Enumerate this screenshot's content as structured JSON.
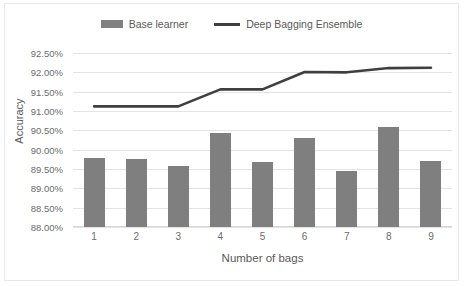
{
  "chart_data": {
    "type": "bar",
    "title": "",
    "xlabel": "Number of bags",
    "ylabel": "Accuracy",
    "categories": [
      "1",
      "2",
      "3",
      "4",
      "5",
      "6",
      "7",
      "8",
      "9"
    ],
    "ylim": [
      88.0,
      92.5
    ],
    "ytick_labels": [
      "92.50%",
      "92.00%",
      "91.50%",
      "91.00%",
      "90.50%",
      "90.00%",
      "89.50%",
      "89.00%",
      "88.50%",
      "88.00%"
    ],
    "ytick_values": [
      92.5,
      92.0,
      91.5,
      91.0,
      90.5,
      90.0,
      89.5,
      89.0,
      88.5,
      88.0
    ],
    "grid": true,
    "legend_position": "top-center",
    "series": [
      {
        "name": "Base learner",
        "type": "bar",
        "color": "#7f7f7f",
        "values": [
          89.78,
          89.77,
          89.57,
          90.42,
          89.68,
          90.31,
          89.45,
          90.58,
          89.71
        ]
      },
      {
        "name": "Deep Bagging Ensemble",
        "type": "line",
        "color": "#3f3f3f",
        "values": [
          91.12,
          91.12,
          91.12,
          91.56,
          91.56,
          92.01,
          92.0,
          92.11,
          92.12
        ]
      }
    ]
  },
  "legend": {
    "entries": [
      {
        "label": "Base learner"
      },
      {
        "label": "Deep Bagging Ensemble"
      }
    ]
  }
}
